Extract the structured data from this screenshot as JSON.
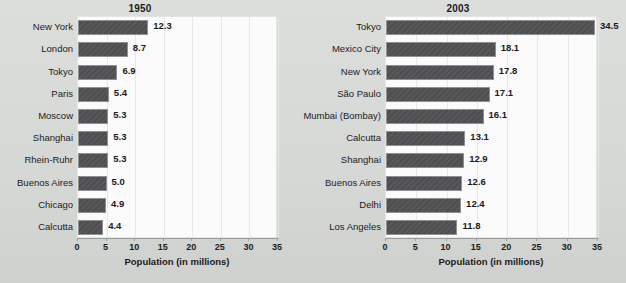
{
  "chart_data": [
    {
      "type": "bar",
      "orientation": "horizontal",
      "title": "1950",
      "xlabel": "Population (in millions)",
      "ylabel": "",
      "xlim": [
        0,
        35
      ],
      "xticks": [
        0,
        5,
        10,
        15,
        20,
        25,
        30,
        35
      ],
      "grid": true,
      "legend": "none",
      "categories": [
        "New York",
        "London",
        "Tokyo",
        "Paris",
        "Moscow",
        "Shanghai",
        "Rhein-Ruhr",
        "Buenos Aires",
        "Chicago",
        "Calcutta"
      ],
      "values": [
        12.3,
        8.7,
        6.9,
        5.4,
        5.3,
        5.3,
        5.3,
        5.0,
        4.9,
        4.4
      ],
      "value_labels": [
        "12.3",
        "8.7",
        "6.9",
        "5.4",
        "5.3",
        "5.3",
        "5.3",
        "5.0",
        "4.9",
        "4.4"
      ]
    },
    {
      "type": "bar",
      "orientation": "horizontal",
      "title": "2003",
      "xlabel": "Population (in millions)",
      "ylabel": "",
      "xlim": [
        0,
        35
      ],
      "xticks": [
        0,
        5,
        10,
        15,
        20,
        25,
        30,
        35
      ],
      "grid": true,
      "legend": "none",
      "categories": [
        "Tokyo",
        "Mexico City",
        "New York",
        "São Paulo",
        "Mumbai (Bombay)",
        "Calcutta",
        "Shanghai",
        "Buenos Aires",
        "Delhi",
        "Los Angeles"
      ],
      "values": [
        34.5,
        18.1,
        17.8,
        17.1,
        16.1,
        13.1,
        12.9,
        12.6,
        12.4,
        11.8
      ],
      "value_labels": [
        "34.5",
        "18.1",
        "17.8",
        "17.1",
        "16.1",
        "13.1",
        "12.9",
        "12.6",
        "12.4",
        "11.8"
      ]
    }
  ],
  "colors": {
    "bar_fill": "#55555700",
    "page_background": "#d8dad8",
    "plot_background": "#fbfbfb",
    "gridline": "#e6e8e6",
    "text": "#1a1a1a"
  }
}
